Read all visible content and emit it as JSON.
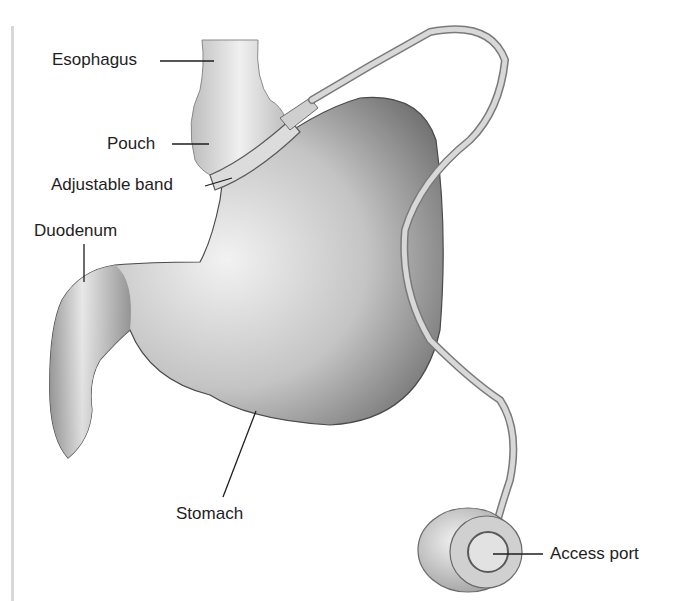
{
  "figure": {
    "labels": {
      "esophagus": "Esophagus",
      "pouch": "Pouch",
      "band": "Adjustable band",
      "duodenum": "Duodenum",
      "stomach": "Stomach",
      "port": "Access port"
    }
  },
  "colors": {
    "text": "#1e1e1e",
    "organ_light": "#e8e8e8",
    "organ_dark": "#7a7a7a",
    "outline": "#3a3a3a",
    "tube": "#cfcfcf"
  }
}
